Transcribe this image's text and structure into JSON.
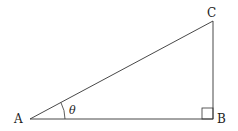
{
  "diagram": {
    "type": "right-triangle",
    "vertices": {
      "A": {
        "label": "A",
        "x": 30,
        "y": 119
      },
      "B": {
        "label": "B",
        "x": 213,
        "y": 119
      },
      "C": {
        "label": "C",
        "x": 213,
        "y": 21
      }
    },
    "angle_label": "θ",
    "angle_at": "A",
    "right_angle_at": "B",
    "colors": {
      "stroke": "#333333",
      "text": "#222222"
    }
  }
}
